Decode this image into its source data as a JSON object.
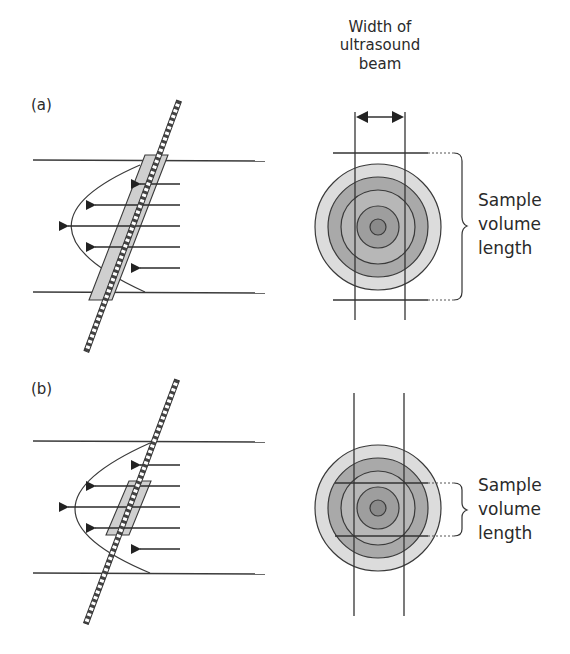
{
  "figure": {
    "panels": [
      {
        "id": "a",
        "label": "(a)",
        "description": "Large sample volume spanning the full vessel diameter",
        "sample_volume_label": [
          "Sample",
          "volume",
          "length"
        ]
      },
      {
        "id": "b",
        "label": "(b)",
        "description": "Small sample volume positioned at vessel center",
        "sample_volume_label": [
          "Sample",
          "volume",
          "length"
        ]
      }
    ],
    "beam_label": [
      "Width of",
      "ultrasound",
      "beam"
    ],
    "colors": {
      "line": "#3a3a3a",
      "sample_box_fill": "#cfcfcf",
      "ring_outer": "#dcdcdc",
      "ring_2": "#a9a9a9",
      "ring_3": "#b7b7b7",
      "ring_4": "#9e9e9e",
      "ring_core": "#8a8a8a",
      "text": "#2a2a2a"
    }
  }
}
